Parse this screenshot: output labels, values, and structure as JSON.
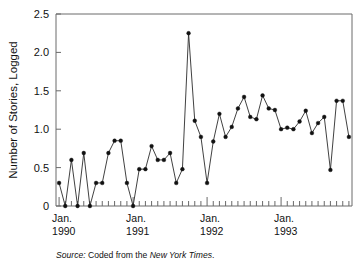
{
  "figure": {
    "source_prefix": "Source:",
    "source_mid": " Coded from the ",
    "source_publication": "New York Times",
    "source_suffix": "."
  },
  "chart_data": {
    "type": "line",
    "title": "",
    "subtitle": "",
    "xlabel": "",
    "ylabel": "Number of Stories, Logged",
    "ylim": [
      0,
      2.5
    ],
    "ytick_labels": [
      "0",
      "0.5",
      "1.0",
      "1.5",
      "2.0",
      "2.5"
    ],
    "ytick_values": [
      0,
      0.5,
      1.0,
      1.5,
      2.0,
      2.5
    ],
    "grid": false,
    "legend": "none",
    "xtick_major_labels": [
      "Jan.\n1990",
      "Jan.\n1991",
      "Jan.\n1992",
      "Jan.\n1993"
    ],
    "xtick_major_lines": [
      [
        "Jan.",
        "1990"
      ],
      [
        "Jan.",
        "1991"
      ],
      [
        "Jan.",
        "1992"
      ],
      [
        "Jan.",
        "1993"
      ]
    ],
    "xtick_major_indices": [
      0,
      12,
      24,
      36
    ],
    "xtick_minor_count": 48,
    "x_interval": "monthly",
    "x_start": "1990-01",
    "x_end": "1993-12",
    "marker": "filled-circle",
    "line_color": "#2b2b2b",
    "marker_color": "#111111",
    "axis_color": "#6a6a6a",
    "x": [
      "Jan 1990",
      "Feb 1990",
      "Mar 1990",
      "Apr 1990",
      "May 1990",
      "Jun 1990",
      "Jul 1990",
      "Aug 1990",
      "Sep 1990",
      "Oct 1990",
      "Nov 1990",
      "Dec 1990",
      "Jan 1991",
      "Feb 1991",
      "Mar 1991",
      "Apr 1991",
      "May 1991",
      "Jun 1991",
      "Jul 1991",
      "Aug 1991",
      "Sep 1991",
      "Oct 1991",
      "Nov 1991",
      "Dec 1991",
      "Jan 1992",
      "Feb 1992",
      "Mar 1992",
      "Apr 1992",
      "May 1992",
      "Jun 1992",
      "Jul 1992",
      "Aug 1992",
      "Sep 1992",
      "Oct 1992",
      "Nov 1992",
      "Dec 1992",
      "Jan 1993",
      "Feb 1993",
      "Mar 1993",
      "Apr 1993",
      "May 1993",
      "Jun 1993",
      "Jul 1993",
      "Aug 1993",
      "Sep 1993",
      "Oct 1993",
      "Nov 1993",
      "Dec 1993"
    ],
    "values": [
      0.3,
      0.0,
      0.6,
      0.0,
      0.69,
      0.0,
      0.3,
      0.3,
      0.69,
      0.85,
      0.85,
      0.3,
      0.0,
      0.48,
      0.48,
      0.78,
      0.6,
      0.6,
      0.69,
      0.3,
      0.48,
      2.25,
      1.11,
      0.9,
      0.3,
      0.84,
      1.2,
      0.9,
      1.03,
      1.27,
      1.42,
      1.16,
      1.13,
      1.44,
      1.27,
      1.25,
      1.0,
      1.02,
      1.0,
      1.1,
      1.24,
      0.95,
      1.08,
      1.16,
      0.47,
      1.37,
      1.37,
      0.9
    ],
    "series": [
      {
        "name": "Number of Stories, Logged",
        "values": [
          0.3,
          0.0,
          0.6,
          0.0,
          0.69,
          0.0,
          0.3,
          0.3,
          0.69,
          0.85,
          0.85,
          0.3,
          0.0,
          0.48,
          0.48,
          0.78,
          0.6,
          0.6,
          0.69,
          0.3,
          0.48,
          2.25,
          1.11,
          0.9,
          0.3,
          0.84,
          1.2,
          0.9,
          1.03,
          1.27,
          1.42,
          1.16,
          1.13,
          1.44,
          1.27,
          1.25,
          1.0,
          1.02,
          1.0,
          1.1,
          1.24,
          0.95,
          1.08,
          1.16,
          0.47,
          1.37,
          1.37,
          0.9
        ]
      }
    ]
  }
}
